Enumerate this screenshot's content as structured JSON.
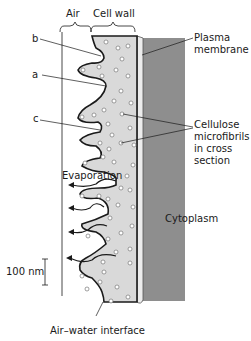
{
  "diagram": {
    "top_labels": {
      "air": "Air",
      "cell_wall": "Cell wall"
    },
    "letter_labels": {
      "b": "b",
      "a": "a",
      "c": "c"
    },
    "right_labels": {
      "plasma_membrane": [
        "Plasma",
        "membrane"
      ],
      "cellulose": [
        "Cellulose",
        "microfibrils",
        "in cross",
        "section"
      ],
      "cytoplasm": "Cytoplasm"
    },
    "evaporation": "Evaporation",
    "scale_bar": "100 nm",
    "bottom_label": "Air–water interface",
    "colors": {
      "cell_wall": "#d9d9d9",
      "cytoplasm": "#8e8e8e",
      "membrane": "#ececec",
      "outline": "#1a1a1a"
    }
  }
}
